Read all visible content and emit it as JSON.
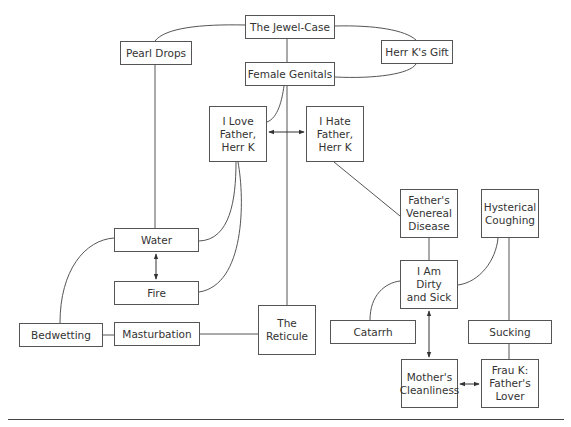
{
  "diagram": {
    "title": "",
    "nodes": [
      {
        "id": "jewel-case",
        "label": "The Jewel-Case",
        "x": 245,
        "y": 15,
        "w": 90,
        "h": 24
      },
      {
        "id": "pearl-drops",
        "label": "Pearl Drops",
        "x": 120,
        "y": 41,
        "w": 72,
        "h": 24
      },
      {
        "id": "herr-k-gift",
        "label": "Herr K's Gift",
        "x": 381,
        "y": 40,
        "w": 72,
        "h": 24
      },
      {
        "id": "female-genitals",
        "label": "Female Genitals",
        "x": 245,
        "y": 62,
        "w": 90,
        "h": 24
      },
      {
        "id": "love-father",
        "label": "I Love\nFather,\nHerr K",
        "x": 209,
        "y": 106,
        "w": 58,
        "h": 56
      },
      {
        "id": "hate-father",
        "label": "I Hate\nFather,\nHerr K",
        "x": 306,
        "y": 106,
        "w": 58,
        "h": 56
      },
      {
        "id": "venereal-disease",
        "label": "Father's\nVenereal\nDisease",
        "x": 400,
        "y": 189,
        "w": 58,
        "h": 49
      },
      {
        "id": "hysterical-coughing",
        "label": "Hysterical\nCoughing",
        "x": 481,
        "y": 189,
        "w": 58,
        "h": 49
      },
      {
        "id": "water",
        "label": "Water",
        "x": 114,
        "y": 228,
        "w": 85,
        "h": 24
      },
      {
        "id": "fire",
        "label": "Fire",
        "x": 114,
        "y": 281,
        "w": 85,
        "h": 24
      },
      {
        "id": "dirty-sick",
        "label": "I Am\nDirty\nand Sick",
        "x": 400,
        "y": 260,
        "w": 58,
        "h": 49
      },
      {
        "id": "bedwetting",
        "label": "Bedwetting",
        "x": 19,
        "y": 323,
        "w": 84,
        "h": 24
      },
      {
        "id": "masturbation",
        "label": "Masturbation",
        "x": 114,
        "y": 322,
        "w": 86,
        "h": 24
      },
      {
        "id": "reticule",
        "label": "The\nReticule",
        "x": 258,
        "y": 305,
        "w": 58,
        "h": 50
      },
      {
        "id": "catarrh",
        "label": "Catarrh",
        "x": 330,
        "y": 320,
        "w": 86,
        "h": 24
      },
      {
        "id": "sucking",
        "label": "Sucking",
        "x": 468,
        "y": 320,
        "w": 84,
        "h": 24
      },
      {
        "id": "mothers-cleanliness",
        "label": "Mother's\nCleanliness",
        "x": 401,
        "y": 359,
        "w": 57,
        "h": 49
      },
      {
        "id": "frau-k",
        "label": "Frau K:\nFather's\nLover",
        "x": 481,
        "y": 359,
        "w": 58,
        "h": 49
      }
    ],
    "edges": [
      {
        "from": "jewel-case",
        "to": "pearl-drops",
        "type": "curve"
      },
      {
        "from": "jewel-case",
        "to": "herr-k-gift",
        "type": "curve"
      },
      {
        "from": "female-genitals",
        "to": "herr-k-gift",
        "type": "curve"
      },
      {
        "from": "jewel-case",
        "to": "female-genitals",
        "type": "line"
      },
      {
        "from": "female-genitals",
        "to": "love-father",
        "type": "curve"
      },
      {
        "from": "female-genitals",
        "to": "reticule",
        "type": "line"
      },
      {
        "from": "love-father",
        "to": "hate-father",
        "type": "double-arrow"
      },
      {
        "from": "pearl-drops",
        "to": "water",
        "type": "line"
      },
      {
        "from": "love-father",
        "to": "water",
        "type": "curve"
      },
      {
        "from": "love-father",
        "to": "fire",
        "type": "curve"
      },
      {
        "from": "water",
        "to": "fire",
        "type": "double-arrow"
      },
      {
        "from": "water",
        "to": "bedwetting",
        "type": "curve"
      },
      {
        "from": "bedwetting",
        "to": "masturbation",
        "type": "line"
      },
      {
        "from": "masturbation",
        "to": "reticule",
        "type": "line"
      },
      {
        "from": "hate-father",
        "to": "venereal-disease",
        "type": "line"
      },
      {
        "from": "venereal-disease",
        "to": "dirty-sick",
        "type": "line"
      },
      {
        "from": "hysterical-coughing",
        "to": "dirty-sick",
        "type": "curve"
      },
      {
        "from": "hysterical-coughing",
        "to": "sucking",
        "type": "line"
      },
      {
        "from": "dirty-sick",
        "to": "catarrh",
        "type": "curve"
      },
      {
        "from": "dirty-sick",
        "to": "mothers-cleanliness",
        "type": "double-arrow"
      },
      {
        "from": "sucking",
        "to": "frau-k",
        "type": "line"
      },
      {
        "from": "mothers-cleanliness",
        "to": "frau-k",
        "type": "double-arrow"
      }
    ],
    "colors": {
      "stroke": "#555555",
      "text": "#333333",
      "background": "#ffffff"
    }
  }
}
